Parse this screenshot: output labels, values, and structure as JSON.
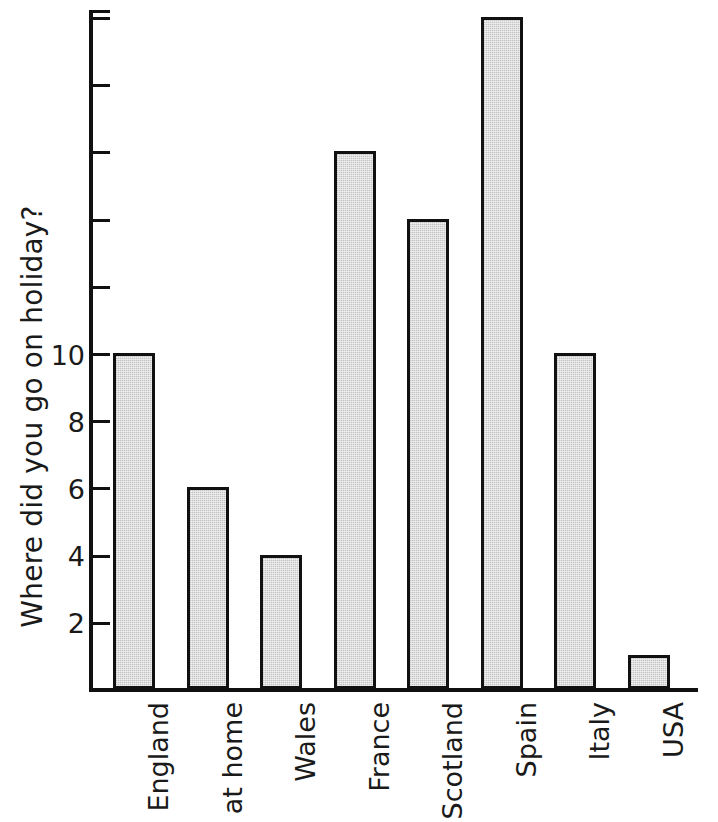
{
  "chart_data": {
    "type": "bar",
    "title": "",
    "subtitle": "",
    "xlabel": "",
    "ylabel": "Where did you go on holiday?",
    "categories": [
      "England",
      "at home",
      "Wales",
      "France",
      "Scotland",
      "Spain",
      "Italy",
      "USA"
    ],
    "values": [
      10,
      6,
      4,
      16,
      14,
      20,
      10,
      1
    ],
    "ylim": [
      0,
      20
    ],
    "ytick_values": [
      2,
      4,
      6,
      8,
      10,
      12,
      14,
      16,
      18,
      20
    ],
    "ytick_labels": [
      "2",
      "4",
      "6",
      "8",
      "10",
      "",
      "",
      "",
      "",
      ""
    ],
    "grid": false,
    "legend": false,
    "legend_position": "none",
    "bar_fill_color": "#dddddd",
    "bar_edge_color": "#111111",
    "axis_color": "#111111",
    "background_color": "#ffffff"
  }
}
